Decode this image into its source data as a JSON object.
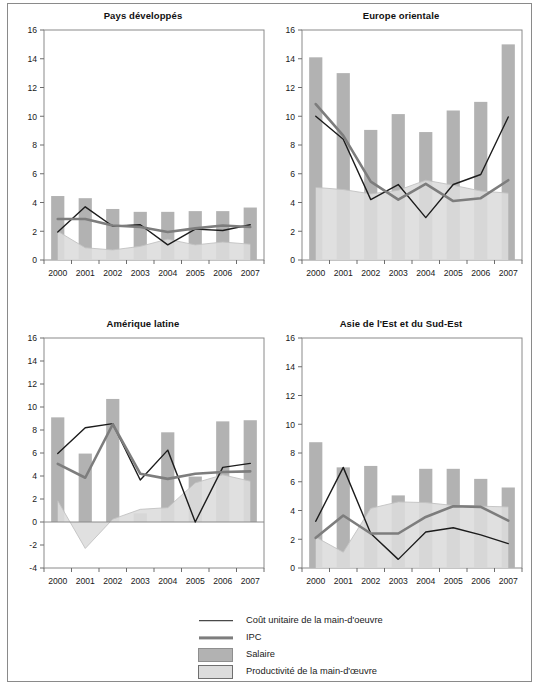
{
  "figure": {
    "clipped_header": "",
    "width": 539,
    "height": 687
  },
  "colors": {
    "salaire_bar": "#b2b2b2",
    "productivite_area": "#dcdcdc",
    "cout_unitaire_line": "#1c1c1c",
    "ipc_line": "#7d7d7d",
    "axis": "#6d6d6d",
    "frame": "#8a8a8a"
  },
  "legend": {
    "items": [
      {
        "key": "line-dark",
        "label": "Coût unitaire de la main-d'oeuvre"
      },
      {
        "key": "line-gray",
        "label": "IPC"
      },
      {
        "key": "swatch-mid",
        "label": "Salaire"
      },
      {
        "key": "swatch-light",
        "label": "Productivité de la main-d'œuvre"
      }
    ]
  },
  "chart_data": [
    {
      "type": "bar",
      "title": "Pays développés",
      "xlabel": "",
      "ylabel": "",
      "categories": [
        "2000",
        "2001",
        "2002",
        "2003",
        "2004",
        "2005",
        "2006",
        "2007"
      ],
      "ylim": [
        0,
        16
      ],
      "yticks": [
        0,
        2,
        4,
        6,
        8,
        10,
        12,
        14,
        16
      ],
      "grid": false,
      "series": [
        {
          "name": "Salaire",
          "render": "bar",
          "values": [
            4.45,
            4.3,
            3.55,
            3.35,
            3.35,
            3.4,
            3.4,
            3.65
          ]
        },
        {
          "name": "Productivité de la main-d'œuvre",
          "render": "area",
          "values": [
            2.0,
            0.85,
            0.7,
            0.95,
            1.45,
            1.05,
            1.25,
            1.1
          ]
        },
        {
          "name": "Coût unitaire de la main-d'oeuvre",
          "render": "line",
          "values": [
            1.95,
            3.7,
            2.35,
            2.45,
            1.05,
            2.15,
            2.05,
            2.45
          ]
        },
        {
          "name": "IPC",
          "render": "line",
          "values": [
            2.85,
            2.85,
            2.4,
            2.3,
            1.95,
            2.2,
            2.4,
            2.3
          ]
        }
      ]
    },
    {
      "type": "bar",
      "title": "Europe orientale",
      "xlabel": "",
      "ylabel": "",
      "categories": [
        "2000",
        "2001",
        "2002",
        "2003",
        "2004",
        "2005",
        "2006",
        "2007"
      ],
      "ylim": [
        0,
        16
      ],
      "yticks": [
        0,
        2,
        4,
        6,
        8,
        10,
        12,
        14,
        16
      ],
      "grid": false,
      "series": [
        {
          "name": "Salaire",
          "render": "bar",
          "values": [
            14.1,
            13.0,
            9.05,
            10.15,
            8.9,
            10.4,
            11.0,
            15.0
          ]
        },
        {
          "name": "Productivité de la main-d'œuvre",
          "render": "area",
          "values": [
            5.05,
            4.9,
            4.6,
            4.85,
            5.55,
            5.2,
            4.8,
            4.65
          ]
        },
        {
          "name": "Coût unitaire de la main-d'oeuvre",
          "render": "line",
          "values": [
            10.0,
            8.4,
            4.2,
            5.25,
            2.95,
            5.25,
            5.95,
            9.95
          ]
        },
        {
          "name": "IPC",
          "render": "line",
          "values": [
            10.85,
            8.65,
            5.45,
            4.2,
            5.3,
            4.1,
            4.3,
            5.55
          ]
        }
      ]
    },
    {
      "type": "bar",
      "title": "Amérique latine",
      "xlabel": "",
      "ylabel": "",
      "categories": [
        "2000",
        "2001",
        "2002",
        "2003",
        "2004",
        "2005",
        "2006",
        "2007"
      ],
      "ylim": [
        -4,
        16
      ],
      "yticks": [
        -4,
        -2,
        0,
        2,
        4,
        6,
        8,
        10,
        12,
        14,
        16
      ],
      "grid": false,
      "series": [
        {
          "name": "Salaire",
          "render": "bar",
          "values": [
            9.1,
            5.95,
            10.7,
            0.75,
            7.8,
            3.95,
            8.75,
            8.85
          ]
        },
        {
          "name": "Productivité de la main-d'œuvre",
          "render": "area",
          "values": [
            1.85,
            -2.3,
            0.25,
            1.1,
            1.25,
            3.4,
            4.1,
            3.55
          ]
        },
        {
          "name": "Coût unitaire de la main-d'oeuvre",
          "render": "line",
          "values": [
            5.95,
            8.2,
            8.55,
            3.65,
            6.25,
            0.0,
            4.75,
            5.1
          ]
        },
        {
          "name": "IPC",
          "render": "line",
          "values": [
            5.05,
            3.85,
            8.5,
            4.2,
            3.75,
            4.2,
            4.35,
            4.4
          ]
        }
      ]
    },
    {
      "type": "bar",
      "title": "Asie de l'Est et du Sud-Est",
      "xlabel": "",
      "ylabel": "",
      "categories": [
        "2000",
        "2001",
        "2002",
        "2003",
        "2004",
        "2005",
        "2006",
        "2007"
      ],
      "ylim": [
        0,
        16
      ],
      "yticks": [
        0,
        2,
        4,
        6,
        8,
        10,
        12,
        14,
        16
      ],
      "grid": false,
      "series": [
        {
          "name": "Salaire",
          "render": "bar",
          "values": [
            8.75,
            7.0,
            7.1,
            5.05,
            6.9,
            6.9,
            6.2,
            5.6
          ]
        },
        {
          "name": "Productivité de la main-d'œuvre",
          "render": "area",
          "values": [
            2.15,
            1.1,
            4.15,
            4.6,
            4.55,
            4.35,
            4.3,
            4.25
          ]
        },
        {
          "name": "Coût unitaire de la main-d'oeuvre",
          "render": "line",
          "values": [
            3.25,
            7.0,
            2.4,
            0.6,
            2.5,
            2.8,
            2.3,
            1.7
          ]
        },
        {
          "name": "IPC",
          "render": "line",
          "values": [
            2.1,
            3.65,
            2.4,
            2.4,
            3.55,
            4.3,
            4.25,
            3.3
          ]
        }
      ]
    }
  ]
}
